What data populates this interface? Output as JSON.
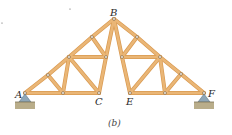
{
  "diagram": {
    "caption": "(b)",
    "colors": {
      "member": "#eab676",
      "member_edge": "#d99a52",
      "pin": "#ffffff",
      "pin_edge": "#6b4a1e",
      "support": "#8fa7b8",
      "ground": "#b9ad8a"
    },
    "labels": {
      "A": "A",
      "B": "B",
      "C": "C",
      "E": "E",
      "F": "F"
    },
    "nodes": {
      "A": [
        25,
        93
      ],
      "B": [
        114,
        19
      ],
      "C": [
        99,
        93
      ],
      "E": [
        130,
        93
      ],
      "F": [
        204,
        93
      ],
      "L1": [
        48,
        75
      ],
      "L2": [
        69,
        57
      ],
      "L3": [
        92,
        37
      ],
      "L4": [
        106,
        57
      ],
      "LB": [
        63,
        93
      ],
      "R1": [
        137,
        37
      ],
      "R2": [
        160,
        57
      ],
      "R3": [
        181,
        74
      ],
      "R4": [
        122,
        57
      ],
      "RB": [
        165,
        93
      ]
    },
    "members": [
      [
        "A",
        "L1"
      ],
      [
        "L1",
        "L2"
      ],
      [
        "L2",
        "L3"
      ],
      [
        "L3",
        "B"
      ],
      [
        "B",
        "R1"
      ],
      [
        "R1",
        "R2"
      ],
      [
        "R2",
        "R3"
      ],
      [
        "R3",
        "F"
      ],
      [
        "A",
        "LB"
      ],
      [
        "LB",
        "C"
      ],
      [
        "E",
        "RB"
      ],
      [
        "RB",
        "F"
      ],
      [
        "L1",
        "LB"
      ],
      [
        "L2",
        "LB"
      ],
      [
        "L2",
        "C"
      ],
      [
        "L2",
        "L4"
      ],
      [
        "L3",
        "L4"
      ],
      [
        "L4",
        "C"
      ],
      [
        "B",
        "L4"
      ],
      [
        "B",
        "R4"
      ],
      [
        "R1",
        "R4"
      ],
      [
        "R4",
        "R2"
      ],
      [
        "R4",
        "E"
      ],
      [
        "R2",
        "E"
      ],
      [
        "R2",
        "RB"
      ],
      [
        "R3",
        "RB"
      ]
    ]
  }
}
